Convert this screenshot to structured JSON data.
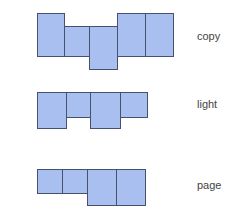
{
  "colors": {
    "fill": "#a9bff0",
    "stroke": "#46516e",
    "text": "#444444"
  },
  "rows": [
    {
      "label": "copy",
      "label_pos": {
        "x": 197,
        "y": 30
      },
      "squares": [
        {
          "x": 37,
          "y": 13,
          "w": 28,
          "h": 44
        },
        {
          "x": 64,
          "y": 26,
          "w": 26,
          "h": 31
        },
        {
          "x": 89,
          "y": 26,
          "w": 29,
          "h": 44
        },
        {
          "x": 117,
          "y": 13,
          "w": 29,
          "h": 44
        },
        {
          "x": 145,
          "y": 13,
          "w": 29,
          "h": 44
        }
      ]
    },
    {
      "label": "light",
      "label_pos": {
        "x": 197,
        "y": 98
      },
      "squares": [
        {
          "x": 37,
          "y": 92,
          "w": 30,
          "h": 37
        },
        {
          "x": 66,
          "y": 92,
          "w": 25,
          "h": 26
        },
        {
          "x": 90,
          "y": 92,
          "w": 31,
          "h": 37
        },
        {
          "x": 120,
          "y": 92,
          "w": 28,
          "h": 26
        }
      ]
    },
    {
      "label": "page",
      "label_pos": {
        "x": 197,
        "y": 179
      },
      "squares": [
        {
          "x": 37,
          "y": 169,
          "w": 26,
          "h": 25
        },
        {
          "x": 62,
          "y": 169,
          "w": 26,
          "h": 25
        },
        {
          "x": 87,
          "y": 169,
          "w": 30,
          "h": 37
        },
        {
          "x": 116,
          "y": 169,
          "w": 30,
          "h": 37
        }
      ]
    }
  ]
}
